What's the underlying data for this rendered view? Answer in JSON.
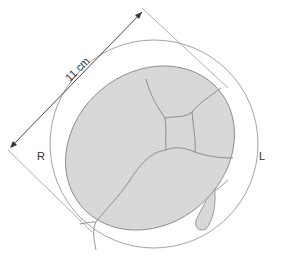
{
  "diagram": {
    "measurement_label": "11 cm",
    "left_side_label": "R",
    "right_side_label": "L",
    "colors": {
      "fill": "#d9d9d9",
      "outline": "#8a8a8a",
      "suture": "#7a7a7a",
      "circle": "#9a9a9a",
      "text": "#333333"
    }
  }
}
